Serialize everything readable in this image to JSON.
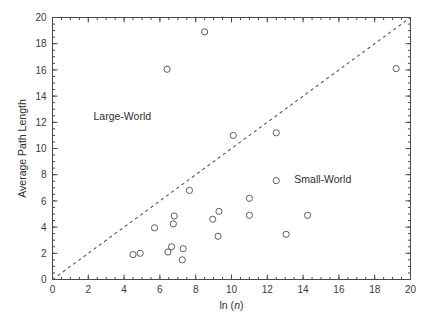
{
  "chart_data": {
    "type": "scatter",
    "title": "",
    "xlabel": "ln (n)",
    "xlabel_prefix": "ln (",
    "xlabel_italic": "n",
    "xlabel_suffix": ")",
    "ylabel": "Average Path Length",
    "xlim": [
      0,
      20
    ],
    "ylim": [
      0,
      20
    ],
    "xticks": [
      0,
      2,
      4,
      6,
      8,
      10,
      12,
      14,
      16,
      18,
      20
    ],
    "yticks": [
      0,
      2,
      4,
      6,
      8,
      10,
      12,
      14,
      16,
      18,
      20
    ],
    "xtick_labels": [
      "0",
      "2",
      "4",
      "6",
      "8",
      "10",
      "12",
      "14",
      "16",
      "18",
      "20"
    ],
    "ytick_labels": [
      "0",
      "2",
      "4",
      "6",
      "8",
      "10",
      "12",
      "14",
      "16",
      "18",
      "20"
    ],
    "xtick_minor_step": 0.5,
    "ytick_minor_step": 0.5,
    "grid": false,
    "legend": false,
    "marker": "open-circle",
    "marker_size": 3.1,
    "marker_color": "#5d5d5d",
    "axis_color": "#4a4a4a",
    "background": "#ffffff",
    "points": [
      {
        "x": 4.5,
        "y": 1.9
      },
      {
        "x": 4.9,
        "y": 2.0
      },
      {
        "x": 5.7,
        "y": 3.95
      },
      {
        "x": 6.4,
        "y": 16.05
      },
      {
        "x": 6.45,
        "y": 2.1
      },
      {
        "x": 6.65,
        "y": 2.5
      },
      {
        "x": 6.75,
        "y": 4.25
      },
      {
        "x": 6.8,
        "y": 4.85
      },
      {
        "x": 7.25,
        "y": 1.5
      },
      {
        "x": 7.3,
        "y": 2.35
      },
      {
        "x": 7.65,
        "y": 6.8
      },
      {
        "x": 8.5,
        "y": 18.9
      },
      {
        "x": 8.95,
        "y": 4.6
      },
      {
        "x": 9.25,
        "y": 3.3
      },
      {
        "x": 9.3,
        "y": 5.2
      },
      {
        "x": 10.1,
        "y": 11.0
      },
      {
        "x": 11.0,
        "y": 6.2
      },
      {
        "x": 11.0,
        "y": 4.9
      },
      {
        "x": 12.5,
        "y": 11.2
      },
      {
        "x": 12.5,
        "y": 7.55
      },
      {
        "x": 13.05,
        "y": 3.45
      },
      {
        "x": 14.25,
        "y": 4.9
      },
      {
        "x": 19.2,
        "y": 16.1
      }
    ],
    "reference_line": {
      "name": "identity-line",
      "style": "dashed",
      "from": [
        0,
        0
      ],
      "to": [
        20,
        20
      ]
    },
    "annotations": [
      {
        "name": "large-world-label",
        "text": "Large-World",
        "x": 3.9,
        "y": 12.2
      },
      {
        "name": "small-world-label",
        "text": "Small-World",
        "x": 15.1,
        "y": 7.4
      }
    ]
  }
}
